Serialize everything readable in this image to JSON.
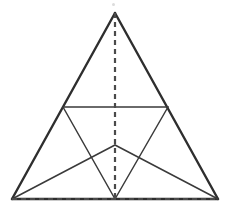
{
  "figure": {
    "canvas": {
      "width": 229,
      "height": 213
    },
    "background_color": "#ffffff",
    "colors": {
      "outer_edge": "#2e2e2e",
      "inner_line": "#3a3a3a",
      "dashed_line": "#4a4a4a",
      "speck": "#dcdcdc"
    },
    "points": {
      "apex": {
        "name": "apex",
        "x": 115,
        "y": 13
      },
      "bottom_left": {
        "name": "bottom-left-corner",
        "x": 12,
        "y": 199
      },
      "bottom_right": {
        "name": "bottom-right-corner",
        "x": 218,
        "y": 199
      },
      "bottom_center": {
        "name": "base-midpoint",
        "x": 115,
        "y": 199
      },
      "left_mid": {
        "name": "left-side-midpoint",
        "x": 63,
        "y": 107
      },
      "right_mid": {
        "name": "right-side-midpoint",
        "x": 168,
        "y": 107
      },
      "inner_vertex": {
        "name": "inner-vertex",
        "x": 115,
        "y": 145
      }
    },
    "segments": [
      {
        "name": "outer-left-edge",
        "style": "solid-outer",
        "from": "apex",
        "to": "bottom_left",
        "x1": 115,
        "y1": 13,
        "x2": 12,
        "y2": 199
      },
      {
        "name": "outer-right-edge",
        "style": "solid-outer",
        "from": "apex",
        "to": "bottom_right",
        "x1": 115,
        "y1": 13,
        "x2": 218,
        "y2": 199
      },
      {
        "name": "base-edge-solid",
        "style": "solid-outer",
        "from": "bottom_left",
        "to": "bottom_right",
        "x1": 12,
        "y1": 199,
        "x2": 218,
        "y2": 199
      },
      {
        "name": "base-edge-dashed-overlay",
        "style": "dashed",
        "from": "bottom_left",
        "to": "bottom_right",
        "x1": 12,
        "y1": 199,
        "x2": 218,
        "y2": 199
      },
      {
        "name": "vertical-altitude-dashed",
        "style": "dashed",
        "from": "apex",
        "to": "bottom_center",
        "x1": 115,
        "y1": 13,
        "x2": 115,
        "y2": 199
      },
      {
        "name": "horizontal-midline",
        "style": "solid-inner",
        "from": "left_mid",
        "to": "right_mid",
        "x1": 63,
        "y1": 107,
        "x2": 168,
        "y2": 107
      },
      {
        "name": "left-mid-to-base-center",
        "style": "solid-inner",
        "from": "left_mid",
        "to": "bottom_center",
        "x1": 63,
        "y1": 107,
        "x2": 115,
        "y2": 199
      },
      {
        "name": "right-mid-to-base-center",
        "style": "solid-inner",
        "from": "right_mid",
        "to": "bottom_center",
        "x1": 168,
        "y1": 107,
        "x2": 115,
        "y2": 199
      },
      {
        "name": "bottom-left-to-inner-vertex",
        "style": "solid-inner",
        "from": "bottom_left",
        "to": "inner_vertex",
        "x1": 12,
        "y1": 199,
        "x2": 115,
        "y2": 145
      },
      {
        "name": "bottom-right-to-inner-vertex",
        "style": "solid-inner",
        "from": "bottom_right",
        "to": "inner_vertex",
        "x1": 218,
        "y1": 199,
        "x2": 115,
        "y2": 145
      }
    ],
    "specks": [
      {
        "name": "top-artifact-speck",
        "x": 112,
        "y": 3,
        "size": 3
      }
    ]
  }
}
